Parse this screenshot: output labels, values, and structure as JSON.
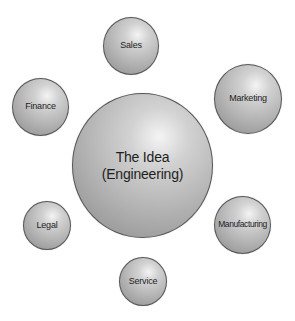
{
  "diagram": {
    "center": {
      "label": "The Idea\n(Engineering)"
    },
    "nodes": [
      {
        "label": "Sales"
      },
      {
        "label": "Marketing"
      },
      {
        "label": "Finance"
      },
      {
        "label": "Legal"
      },
      {
        "label": "Manufacturing"
      },
      {
        "label": "Service"
      }
    ]
  }
}
